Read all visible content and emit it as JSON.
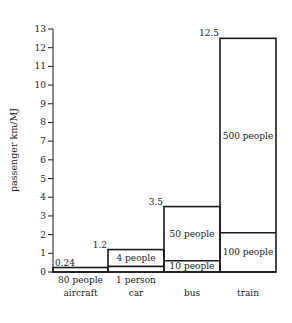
{
  "chart_data": {
    "type": "bar",
    "subtype": "stacked-bar",
    "title": "",
    "xlabel": "",
    "ylabel": "passenger km/MJ",
    "ylim": [
      0,
      13
    ],
    "yticks": [
      0,
      1,
      2,
      3,
      4,
      5,
      6,
      7,
      8,
      9,
      10,
      11,
      12,
      13
    ],
    "grid": false,
    "categories": [
      "aircraft",
      "car",
      "bus",
      "train"
    ],
    "totals": [
      0.24,
      1.2,
      3.5,
      12.5
    ],
    "total_labels": [
      "0.24",
      "1.2",
      "3.5",
      "12.5"
    ],
    "series": [
      {
        "name": "lower occupancy",
        "values": [
          0.24,
          0.3,
          0.6,
          2.1
        ],
        "labels": [
          "80 people",
          "1 person",
          "10 people",
          "100 people"
        ]
      },
      {
        "name": "higher occupancy",
        "values": [
          0,
          1.2,
          3.5,
          12.5
        ],
        "labels": [
          "",
          "4 people",
          "50 people",
          "500 people"
        ]
      }
    ]
  },
  "colors": {
    "stroke": "#1a1a1a",
    "text": "#222222",
    "background": "#ffffff"
  }
}
